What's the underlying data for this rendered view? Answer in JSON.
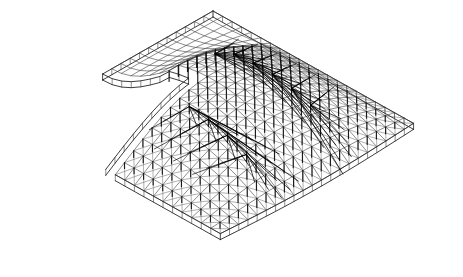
{
  "figure": {
    "title": "Axonometric wireframe of a doubly-curved cable-supported grid-shell roof",
    "kind": "3d-wireframe-line-drawing",
    "background_color": "#ffffff",
    "line_color": "#1a1a1a",
    "grid_line_color": "#3c3c3c",
    "brace_line_color": "#000000",
    "strut_line_color": "#111111",
    "canvas": {
      "width": 463,
      "height": 277
    }
  },
  "projection": {
    "type": "axonometric",
    "u_axis_px": {
      "dx": 9.55,
      "dy": 5.35
    },
    "v_axis_px": {
      "dx": -9.2,
      "dy": 5.25
    },
    "origin_px": {
      "x": 213.0,
      "y": 11.0
    }
  },
  "plan": {
    "u_divisions": 21,
    "v_divisions": 21,
    "notch": {
      "present": true,
      "corner_label": "re-entrant-corner",
      "u_start": 0,
      "u_end": 9,
      "v_start": 12,
      "v_end": 21
    }
  },
  "surface": {
    "description": "saddle / barrel vault rising along the central ridge and falling to the four edges",
    "ridge_height_px": 46,
    "edge_droop_px": 18,
    "flat_wing": "left plan wing is nearly planar"
  },
  "bracing": {
    "description": "fan bundles of taut straight members converging from upper grid nodes down to low anchor nodes",
    "fan_count": 12,
    "members_per_fan": 7,
    "anchor_spacing_u": 2,
    "anchor_spacing_v": 2
  },
  "struts": {
    "description": "short vertical posts dropped from each interior grid node",
    "length_px": 11,
    "count_approx": 150
  },
  "edge_beams": {
    "description": "doubled fascia band running along the free perimeter edges",
    "offset_px": 6
  },
  "extents_px": {
    "top_corner": {
      "x": 213,
      "y": 8
    },
    "left_corner": {
      "x": 14,
      "y": 158
    },
    "right_corner": {
      "x": 452,
      "y": 166
    },
    "bottom_corner": {
      "x": 305,
      "y": 266
    },
    "notch_vertex": {
      "x": 104,
      "y": 182
    }
  },
  "labels": {
    "caption": ""
  }
}
